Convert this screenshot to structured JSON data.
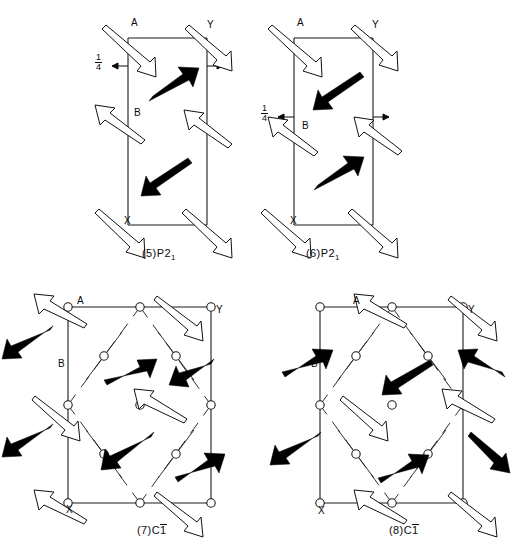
{
  "figure": {
    "width": 517,
    "height": 555,
    "background": "#ffffff",
    "ink": "#000000"
  },
  "panels": [
    {
      "id": "panel-5",
      "caption_prefix": "(5)",
      "caption_group": "P2",
      "caption_sub": "1",
      "caption_overbar": "",
      "caption_full": "(5)P2₁",
      "cell_type": "rectangle",
      "vertex_labels": [
        {
          "name": "A",
          "text": "A",
          "x": 131,
          "y": 24
        },
        {
          "name": "Y",
          "text": "Y",
          "x": 207,
          "y": 26
        },
        {
          "name": "B",
          "text": "B",
          "x": 134,
          "y": 114
        },
        {
          "name": "X",
          "text": "X",
          "x": 124,
          "y": 222
        }
      ],
      "fraction_label": {
        "numerator": "1",
        "denominator": "4",
        "x": 97,
        "y": 56
      },
      "has_left_tick_arrow": true,
      "has_right_tick_arrow": true
    },
    {
      "id": "panel-6",
      "caption_prefix": "(6)",
      "caption_group": "P2",
      "caption_sub": "1",
      "caption_overbar": "",
      "caption_full": "(6)P2₁",
      "cell_type": "rectangle",
      "vertex_labels": [
        {
          "name": "A",
          "text": "A",
          "x": 297,
          "y": 24
        },
        {
          "name": "Y",
          "text": "Y",
          "x": 372,
          "y": 26
        },
        {
          "name": "B",
          "text": "B",
          "x": 302,
          "y": 127
        },
        {
          "name": "X",
          "text": "X",
          "x": 290,
          "y": 222
        }
      ],
      "fraction_label": {
        "numerator": "1",
        "denominator": "4",
        "x": 263,
        "y": 107
      },
      "has_left_tick_arrow": true,
      "has_right_tick_arrow": true
    },
    {
      "id": "panel-7",
      "caption_prefix": "(7)",
      "caption_group": "C",
      "caption_sub": "",
      "caption_overbar": "1",
      "caption_full": "(7)C̱1̄",
      "cell_type": "square-with-diamond",
      "vertex_labels": [
        {
          "name": "A",
          "text": "A",
          "x": 77,
          "y": 296
        },
        {
          "name": "Y",
          "text": "Y",
          "x": 215,
          "y": 304
        },
        {
          "name": "B",
          "text": "B",
          "x": 58,
          "y": 361
        },
        {
          "name": "X",
          "text": "X",
          "x": 66,
          "y": 506
        }
      ],
      "fraction_label": null,
      "has_left_tick_arrow": false,
      "has_right_tick_arrow": false
    },
    {
      "id": "panel-8",
      "caption_prefix": "(8)",
      "caption_group": "C",
      "caption_sub": "",
      "caption_overbar": "1",
      "caption_full": "(8)C̱1̄",
      "cell_type": "square-with-diamond",
      "vertex_labels": [
        {
          "name": "A",
          "text": "A",
          "x": 353,
          "y": 296
        },
        {
          "name": "Y",
          "text": "Y",
          "x": 456,
          "y": 304
        },
        {
          "name": "B",
          "text": "B",
          "x": 311,
          "y": 361
        },
        {
          "name": "X",
          "text": "X",
          "x": 318,
          "y": 507
        }
      ],
      "fraction_label": null,
      "has_left_tick_arrow": false,
      "has_right_tick_arrow": false
    }
  ],
  "legend_notes": {
    "solid_arrow_meaning": "solid-filled-moment-arrow",
    "open_arrow_meaning": "open-outlined-moment-arrow",
    "circle_meaning": "lattice-site-circle"
  }
}
